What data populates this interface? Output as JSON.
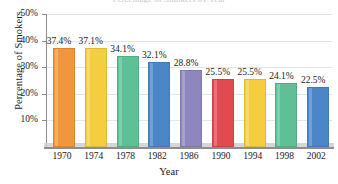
{
  "chart_data": {
    "type": "bar",
    "title": "Percentage of Smokers by Year",
    "xlabel": "Year",
    "ylabel": "Percentage of Smokers",
    "categories": [
      "1970",
      "1974",
      "1978",
      "1982",
      "1986",
      "1990",
      "1994",
      "1998",
      "2002"
    ],
    "values": [
      37.4,
      37.1,
      34.1,
      32.1,
      28.8,
      25.5,
      25.5,
      24.1,
      22.5
    ],
    "value_labels": [
      "37.4%",
      "37.1%",
      "34.1%",
      "32.1%",
      "28.8%",
      "25.5%",
      "25.5%",
      "24.1%",
      "22.5%"
    ],
    "ylim": [
      0,
      50
    ],
    "ytick_values": [
      10,
      20,
      30,
      40,
      50
    ],
    "ytick_labels": [
      "10%",
      "20%",
      "30%",
      "40%",
      "50%"
    ],
    "grid": true,
    "legend": "none",
    "bar_colors": [
      "#F0963C",
      "#F5CE40",
      "#5FBF96",
      "#4A86C8",
      "#8E86BE",
      "#E04A50",
      "#F5CE40",
      "#5FBF96",
      "#4A86C8"
    ],
    "axis_color": "#8E8E8E",
    "grid_color": "#E2E6EA"
  }
}
